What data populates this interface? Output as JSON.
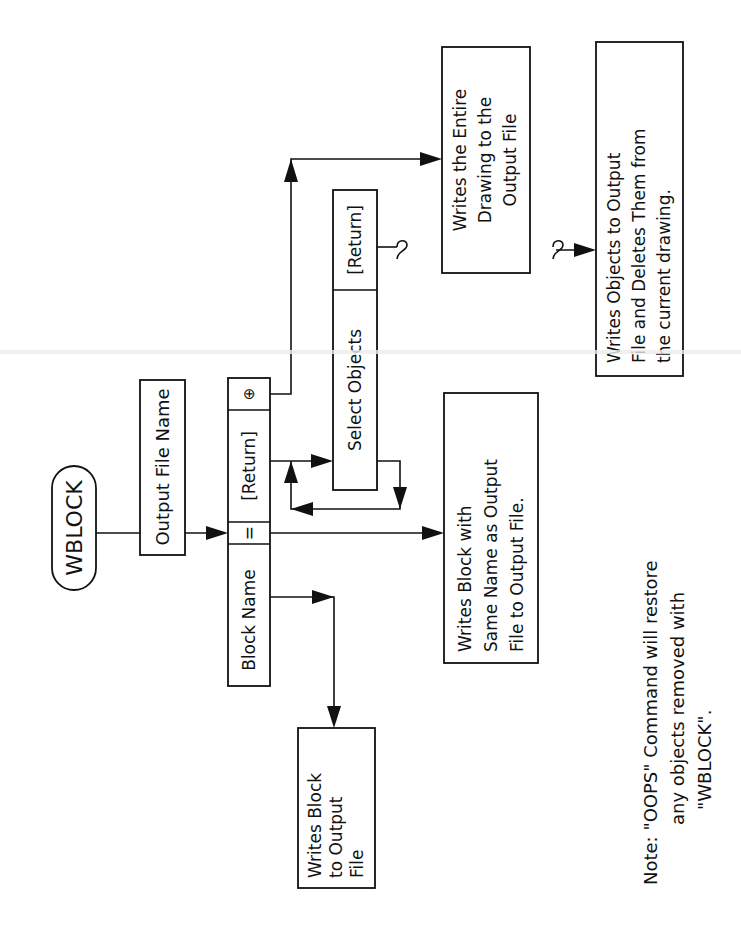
{
  "diagram": {
    "title": "WBLOCK",
    "nodes": {
      "start": {
        "label": "WBLOCK"
      },
      "output_file_name": {
        "label": "Output File Name"
      },
      "prompt_row": {
        "block_name": "Block Name",
        "equals": "=",
        "return": "[Return]",
        "asterisk": "⊕"
      },
      "select_row": {
        "select_objects": "Select Objects",
        "return": "[Return]"
      },
      "writes_entire": {
        "lines": [
          "Writes the Entire",
          "Drawing to the",
          "Output File"
        ]
      },
      "writes_objects": {
        "lines": [
          "Writes Objects to Output",
          "File and Deletes Them from",
          "the current drawing."
        ]
      },
      "writes_same_name": {
        "lines": [
          "Writes Block with",
          "Same Name as Output",
          "File to Output File."
        ]
      },
      "writes_block": {
        "lines": [
          "Writes Block",
          "to Output",
          "File"
        ]
      }
    },
    "note": {
      "lines": [
        "Note:  \"OOPS\" Command will restore",
        "any objects removed with",
        "\"WBLOCK\"."
      ]
    },
    "connector_symbol": "∫"
  }
}
